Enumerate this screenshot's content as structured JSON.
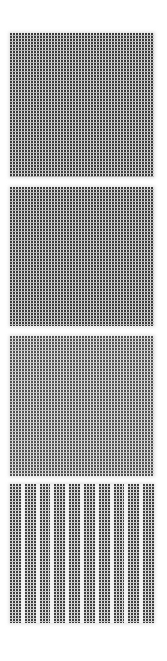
{
  "canvas": {
    "width": 167,
    "height": 661,
    "background": "#ffffff"
  },
  "swatches": [
    {
      "id": "swatch-1",
      "pattern": "dot-grid",
      "top": 33,
      "height": 144,
      "dot_color": "#3a3a3a",
      "dot_pitch_px": 3
    },
    {
      "id": "swatch-2",
      "pattern": "dot-grid",
      "top": 187,
      "height": 139,
      "dot_color": "#3a3a3a",
      "dot_pitch_px": 3
    },
    {
      "id": "swatch-3",
      "pattern": "dot-grid-light",
      "top": 336,
      "height": 140,
      "dot_color": "#505050",
      "dot_pitch_px": 3
    },
    {
      "id": "swatch-4",
      "pattern": "dot-columns",
      "top": 484,
      "height": 139,
      "dot_color": "#3e3e3e",
      "dot_pitch_px": 3,
      "column_count": 10
    }
  ]
}
